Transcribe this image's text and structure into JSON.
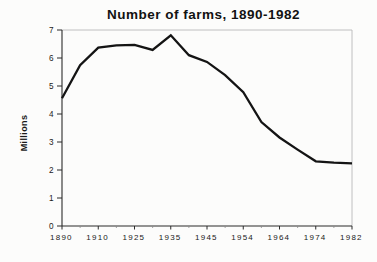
{
  "header": {
    "title": "Number of farms, 1890-1982"
  },
  "chart_data": {
    "type": "line",
    "title": "Number of farms, 1890-1982",
    "xlabel": "",
    "ylabel": "Millions",
    "x_categories": [
      "1890",
      "1900",
      "1910",
      "1920",
      "1925",
      "1930",
      "1935",
      "1940",
      "1945",
      "1950",
      "1954",
      "1959",
      "1964",
      "1969",
      "1974",
      "1978",
      "1982"
    ],
    "values": [
      4.56,
      5.74,
      6.37,
      6.45,
      6.47,
      6.29,
      6.81,
      6.1,
      5.86,
      5.39,
      4.78,
      3.71,
      3.16,
      2.73,
      2.31,
      2.26,
      2.24
    ],
    "series_name": "Number of farms (millions)",
    "labeled_tick_indices": [
      0,
      2,
      4,
      6,
      8,
      10,
      12,
      14,
      16
    ],
    "x_tick_labels": [
      "1890",
      "1910",
      "1925",
      "1935",
      "1945",
      "1954",
      "1964",
      "1974",
      "1982"
    ],
    "y_ticks": [
      0,
      1,
      2,
      3,
      4,
      5,
      6,
      7
    ],
    "ylim": [
      0,
      7
    ],
    "x_axis_spacing": "even-categorical",
    "grid": false,
    "legend": false,
    "colors": {
      "line": "#141414",
      "axis": "#2b2b2b",
      "frame": "#b9b9b9",
      "minor_tick": "#8a8a8a",
      "text": "#1a1a1a",
      "background": "#fcfcfb"
    },
    "line_width": 2.3
  }
}
